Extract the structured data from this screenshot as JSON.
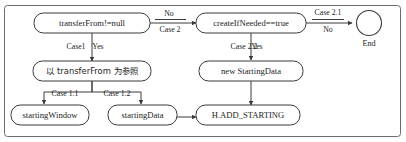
{
  "diagram": {
    "frame": {
      "border_color": "#6b6b6b"
    },
    "colors": {
      "node_stroke": "#3a3a3a",
      "node_fill": "#ffffff",
      "edge": "#3a3a3a",
      "text": "#1c1c1c",
      "frame": "#6b6b6b",
      "background": "#ffffff"
    },
    "nodes": [
      {
        "id": "transferFrom",
        "label": "transferFrom!=null",
        "shape": "rounded-rect",
        "script": "latin"
      },
      {
        "id": "createIfNeeded",
        "label": "createIfNeeded==true",
        "shape": "rounded-rect",
        "script": "latin"
      },
      {
        "id": "end",
        "label": "End",
        "shape": "circle",
        "script": "latin"
      },
      {
        "id": "refTransferFrom",
        "label": "以 transferFrom 为参照",
        "shape": "rounded-rect",
        "script": "cjk"
      },
      {
        "id": "newStartingData",
        "label": "new StartingData",
        "shape": "rounded-rect",
        "script": "latin"
      },
      {
        "id": "startingWindow",
        "label": "startingWindow",
        "shape": "rounded-rect",
        "script": "latin"
      },
      {
        "id": "startingData",
        "label": "startingData",
        "shape": "rounded-rect",
        "script": "latin"
      },
      {
        "id": "addStarting",
        "label": "H.ADD_STARTING",
        "shape": "rounded-rect",
        "script": "latin"
      }
    ],
    "edges": [
      {
        "id": "e1",
        "from": "transferFrom",
        "to": "createIfNeeded",
        "label_top": "No",
        "label_bottom": "Case 2"
      },
      {
        "id": "e2",
        "from": "createIfNeeded",
        "to": "end",
        "label_top": "Case 2.1",
        "label_bottom": "No"
      },
      {
        "id": "e3",
        "from": "transferFrom",
        "to": "refTransferFrom",
        "label_left": "Case1",
        "label_right": "Yes"
      },
      {
        "id": "e4",
        "from": "createIfNeeded",
        "to": "newStartingData",
        "label_left": "Case 2.2",
        "label_right": "Yes"
      },
      {
        "id": "e5",
        "from": "refTransferFrom",
        "to": "startingWindow",
        "label": "Case 1.1"
      },
      {
        "id": "e6",
        "from": "refTransferFrom",
        "to": "startingData",
        "label": "Case 1.2"
      },
      {
        "id": "e7",
        "from": "startingData",
        "to": "addStarting",
        "label": ""
      },
      {
        "id": "e8",
        "from": "newStartingData",
        "to": "addStarting",
        "label": ""
      }
    ]
  }
}
